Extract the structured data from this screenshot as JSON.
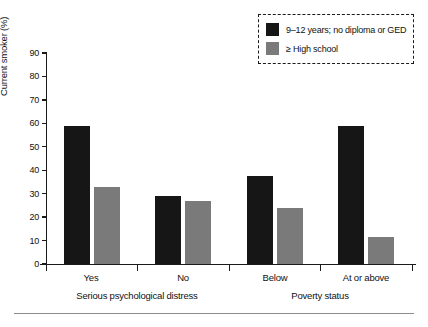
{
  "chart_data": {
    "type": "bar",
    "title": "",
    "xlabel": "",
    "ylabel": "Current smoker (%)",
    "ylim": [
      0,
      90
    ],
    "yticks": [
      "0",
      "10",
      "20",
      "30",
      "40",
      "50",
      "60",
      "70",
      "80",
      "90"
    ],
    "grid": false,
    "legend_position": "top-right",
    "categories": [
      "Yes",
      "No",
      "Below",
      "At or above"
    ],
    "group_labels": [
      "Serious psychological distress",
      "Poverty status"
    ],
    "groups": [
      {
        "label": "Serious psychological distress",
        "categories": [
          "Yes",
          "No"
        ]
      },
      {
        "label": "Poverty status",
        "categories": [
          "Below",
          "At or above"
        ]
      }
    ],
    "series": [
      {
        "name": "9–12 years; no diploma or GED",
        "color": "#161616",
        "values": [
          59,
          29,
          37.5,
          59
        ]
      },
      {
        "name": "≥ High school",
        "color": "#7a7a7a",
        "values": [
          33,
          27,
          24,
          11.5
        ]
      }
    ]
  },
  "legend": {
    "items": [
      {
        "label": "9–12 years; no diploma or GED",
        "color": "#161616"
      },
      {
        "label": "≥ High school",
        "color": "#7a7a7a"
      }
    ]
  },
  "axes": {
    "y_label": "Current smoker (%)",
    "y_ticks": [
      "90",
      "80",
      "70",
      "60",
      "50",
      "40",
      "30",
      "20",
      "10",
      "0"
    ]
  },
  "x_axis": {
    "category_labels": [
      "Yes",
      "No",
      "Below",
      "At or above"
    ],
    "group_labels": [
      "Serious psychological distress",
      "Poverty status"
    ]
  },
  "colors": {
    "series_black": "#161616",
    "series_gray": "#7a7a7a",
    "axis": "#1a1a1a",
    "rule": "#8d8d8d",
    "background": "#ffffff"
  }
}
